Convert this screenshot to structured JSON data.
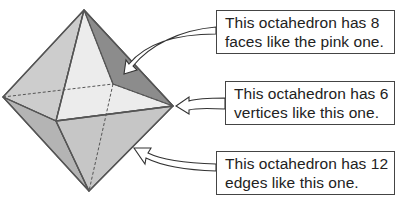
{
  "callouts": {
    "faces": {
      "line1": "This octahedron has 8",
      "line2": "faces like the pink one."
    },
    "vertices": {
      "line1": "This octahedron has 6",
      "line2": "vertices like this one."
    },
    "edges": {
      "line1": "This octahedron has 12",
      "line2": "edges like this one."
    }
  },
  "octahedron": {
    "vertices": {
      "top": [
        84,
        10
      ],
      "left": [
        3,
        97
      ],
      "front": [
        56,
        121
      ],
      "right": [
        173,
        106
      ],
      "bottom": [
        89,
        191
      ],
      "back": [
        113,
        84
      ]
    },
    "colors": {
      "face_top_left": "#cdcdcd",
      "face_top_front": "#ececec",
      "face_top_right_highlighted": "#8c8c8c",
      "face_bottom_left": "#b4b4b4",
      "face_bottom_front": "#c6c6c6",
      "edge": "#555555",
      "hidden_edge": "#555555"
    }
  }
}
